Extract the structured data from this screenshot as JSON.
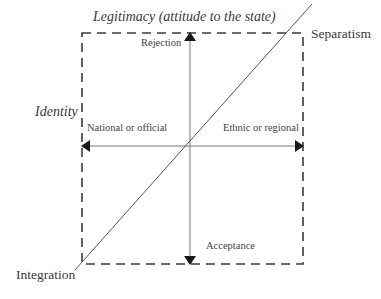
{
  "diagram": {
    "title_top": "Legitimacy (attitude to the state)",
    "title_left": "Identity",
    "vertical_axis": {
      "top_label": "Rejection",
      "bottom_label": "Acceptance"
    },
    "horizontal_axis": {
      "left_label": "National or official",
      "right_label": "Ethnic or regional"
    },
    "diagonal": {
      "top_right_label": "Separatism",
      "bottom_left_label": "Integration"
    },
    "colors": {
      "line": "#555555",
      "arrowhead": "#1a1a1a",
      "dash": "#3a3a3a",
      "text": "#3a3a3a"
    }
  }
}
